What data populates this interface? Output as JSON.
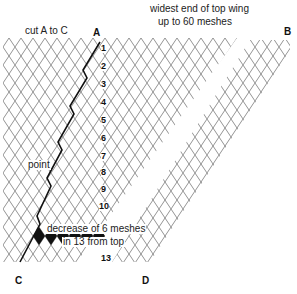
{
  "diagram": {
    "title_left": "cut A to C",
    "title_right_line1": "widest end of top wing",
    "title_right_line2": "up to 60 meshes",
    "point_label": "point",
    "decrease_line1": "decrease of 6 meshes",
    "decrease_line2": "in 13 from top",
    "corner_labels": {
      "A": "A",
      "B": "B",
      "C": "C",
      "D": "D"
    },
    "row_numbers": [
      "1",
      "2",
      "3",
      "4",
      "5",
      "6",
      "7",
      "8",
      "9",
      "10",
      "13"
    ],
    "caption_partial": "Fig. ... (cut off)",
    "colors": {
      "mesh": "#777777",
      "cut_line": "#111111",
      "filled_mesh": "#111111"
    }
  }
}
